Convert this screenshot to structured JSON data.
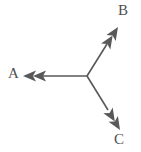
{
  "figure": {
    "background_color": "#ffffff",
    "stroke_color": "#595959",
    "label_color": "#4f4f4f",
    "line_width": 1.6,
    "origin": {
      "x": 87,
      "y": 76
    }
  },
  "vectors": [
    {
      "id": "a",
      "label": "A",
      "direction": "left",
      "arrowheads": 2,
      "start": {
        "x": 87,
        "y": 76
      },
      "end": {
        "x": 23,
        "y": 76
      },
      "angle_deg": 180,
      "label_position": {
        "x": 8,
        "y": 66
      }
    },
    {
      "id": "b",
      "label": "B",
      "direction": "up-right",
      "arrowheads": 2,
      "start": {
        "x": 87,
        "y": 76
      },
      "end": {
        "x": 118,
        "y": 27
      },
      "angle_deg": -57.7,
      "label_position": {
        "x": 118,
        "y": 3
      }
    },
    {
      "id": "c",
      "label": "C",
      "direction": "down-right",
      "arrowheads": 2,
      "start": {
        "x": 87,
        "y": 76
      },
      "end": {
        "x": 120,
        "y": 130
      },
      "angle_deg": 58.6,
      "label_position": {
        "x": 114,
        "y": 132
      }
    }
  ]
}
